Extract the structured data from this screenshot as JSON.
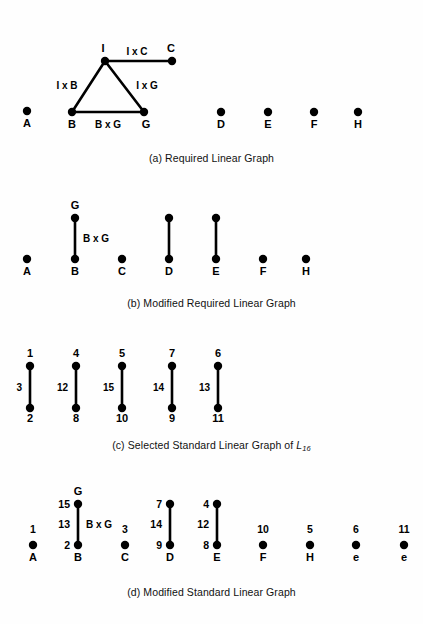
{
  "figure": {
    "background_color": "#fefefe",
    "ink_color": "#000000"
  },
  "panels": [
    {
      "id": "a",
      "caption": "(a) Required Linear Graph",
      "caption_y": 158,
      "nodes": [
        {
          "name": "A",
          "label": "A",
          "x": 27,
          "y": 111,
          "label_x": 27,
          "label_y": 127,
          "label_anchor": "middle"
        },
        {
          "name": "B",
          "label": "B",
          "x": 72,
          "y": 112,
          "label_x": 72,
          "label_y": 128,
          "label_anchor": "middle"
        },
        {
          "name": "G",
          "label": "G",
          "x": 144,
          "y": 112,
          "label_x": 146,
          "label_y": 128,
          "label_anchor": "middle"
        },
        {
          "name": "I",
          "label": "I",
          "x": 105,
          "y": 61,
          "label_x": 103,
          "label_y": 52,
          "label_anchor": "middle"
        },
        {
          "name": "C",
          "label": "C",
          "x": 172,
          "y": 61,
          "label_x": 171,
          "label_y": 52,
          "label_anchor": "middle"
        },
        {
          "name": "D",
          "label": "D",
          "x": 221,
          "y": 112,
          "label_x": 221,
          "label_y": 128,
          "label_anchor": "middle"
        },
        {
          "name": "E",
          "label": "E",
          "x": 268,
          "y": 112,
          "label_x": 268,
          "label_y": 128,
          "label_anchor": "middle"
        },
        {
          "name": "F",
          "label": "F",
          "x": 314,
          "y": 112,
          "label_x": 314,
          "label_y": 128,
          "label_anchor": "middle"
        },
        {
          "name": "H",
          "label": "H",
          "x": 358,
          "y": 112,
          "label_x": 358,
          "label_y": 128,
          "label_anchor": "middle"
        }
      ],
      "edges": [
        {
          "name": "edge-I-C",
          "x1": 105,
          "y1": 61,
          "x2": 172,
          "y2": 61,
          "label": "I x C",
          "label_x": 137,
          "label_y": 55,
          "label_anchor": "middle"
        },
        {
          "name": "edge-I-B",
          "x1": 105,
          "y1": 61,
          "x2": 72,
          "y2": 112,
          "label": "I x B",
          "label_x": 67,
          "label_y": 89,
          "label_anchor": "middle"
        },
        {
          "name": "edge-I-G",
          "x1": 105,
          "y1": 61,
          "x2": 144,
          "y2": 112,
          "label": "I x G",
          "label_x": 147,
          "label_y": 89,
          "label_anchor": "middle"
        },
        {
          "name": "edge-B-G",
          "x1": 72,
          "y1": 112,
          "x2": 144,
          "y2": 112,
          "label": "B x G",
          "label_x": 108,
          "label_y": 128,
          "label_anchor": "middle"
        }
      ]
    },
    {
      "id": "b",
      "caption": "(b) Modified Required Linear Graph",
      "caption_y": 303,
      "nodes": [
        {
          "name": "A",
          "label": "A",
          "x": 27,
          "y": 259,
          "label_x": 27,
          "label_y": 275,
          "label_anchor": "middle"
        },
        {
          "name": "B",
          "label": "B",
          "x": 75,
          "y": 259,
          "label_x": 75,
          "label_y": 275,
          "label_anchor": "middle"
        },
        {
          "name": "G",
          "label": "G",
          "x": 75,
          "y": 218,
          "label_x": 75,
          "label_y": 209,
          "label_anchor": "middle"
        },
        {
          "name": "C",
          "label": "C",
          "x": 122,
          "y": 259,
          "label_x": 122,
          "label_y": 275,
          "label_anchor": "middle"
        },
        {
          "name": "D",
          "label": "D",
          "x": 169,
          "y": 259,
          "label_x": 169,
          "label_y": 275,
          "label_anchor": "middle"
        },
        {
          "name": "E",
          "label": "E",
          "x": 216,
          "y": 259,
          "label_x": 216,
          "label_y": 275,
          "label_anchor": "middle"
        },
        {
          "name": "F",
          "label": "F",
          "x": 263,
          "y": 259,
          "label_x": 263,
          "label_y": 275,
          "label_anchor": "middle"
        },
        {
          "name": "H",
          "label": "H",
          "x": 306,
          "y": 259,
          "label_x": 306,
          "label_y": 275,
          "label_anchor": "middle"
        },
        {
          "name": "D-top",
          "label": "",
          "x": 169,
          "y": 218,
          "label_x": 169,
          "label_y": 218,
          "label_anchor": "middle"
        },
        {
          "name": "E-top",
          "label": "",
          "x": 216,
          "y": 218,
          "label_x": 216,
          "label_y": 218,
          "label_anchor": "middle"
        }
      ],
      "edges": [
        {
          "name": "edge-B-G",
          "x1": 75,
          "y1": 218,
          "x2": 75,
          "y2": 259,
          "label": "B x G",
          "label_x": 83,
          "label_y": 242,
          "label_anchor": "start"
        },
        {
          "name": "edge-D",
          "x1": 169,
          "y1": 218,
          "x2": 169,
          "y2": 259,
          "label": "",
          "label_x": 169,
          "label_y": 242,
          "label_anchor": "start"
        },
        {
          "name": "edge-E",
          "x1": 216,
          "y1": 218,
          "x2": 216,
          "y2": 259,
          "label": "",
          "label_x": 216,
          "label_y": 242,
          "label_anchor": "start"
        }
      ]
    },
    {
      "id": "c",
      "caption_prefix": "(c) Selected Standard Linear Graph of ",
      "caption_symbol": "L",
      "caption_subscript": "16",
      "caption_y": 445,
      "nodes": [
        {
          "name": "node-1",
          "label": "1",
          "x": 30,
          "y": 366,
          "label_x": 30,
          "label_y": 357,
          "label_anchor": "middle"
        },
        {
          "name": "node-2",
          "label": "2",
          "x": 30,
          "y": 408,
          "label_x": 30,
          "label_y": 422,
          "label_anchor": "middle"
        },
        {
          "name": "node-4",
          "label": "4",
          "x": 76,
          "y": 366,
          "label_x": 76,
          "label_y": 357,
          "label_anchor": "middle"
        },
        {
          "name": "node-8",
          "label": "8",
          "x": 76,
          "y": 408,
          "label_x": 76,
          "label_y": 422,
          "label_anchor": "middle"
        },
        {
          "name": "node-5",
          "label": "5",
          "x": 122,
          "y": 366,
          "label_x": 122,
          "label_y": 357,
          "label_anchor": "middle"
        },
        {
          "name": "node-10",
          "label": "10",
          "x": 122,
          "y": 408,
          "label_x": 122,
          "label_y": 422,
          "label_anchor": "middle"
        },
        {
          "name": "node-7",
          "label": "7",
          "x": 172,
          "y": 366,
          "label_x": 172,
          "label_y": 357,
          "label_anchor": "middle"
        },
        {
          "name": "node-9",
          "label": "9",
          "x": 172,
          "y": 408,
          "label_x": 172,
          "label_y": 422,
          "label_anchor": "middle"
        },
        {
          "name": "node-6",
          "label": "6",
          "x": 218,
          "y": 366,
          "label_x": 218,
          "label_y": 357,
          "label_anchor": "middle"
        },
        {
          "name": "node-11",
          "label": "11",
          "x": 218,
          "y": 408,
          "label_x": 218,
          "label_y": 422,
          "label_anchor": "middle"
        }
      ],
      "edges": [
        {
          "name": "edge-3",
          "x1": 30,
          "y1": 366,
          "x2": 30,
          "y2": 408,
          "label": "3",
          "label_x": 22,
          "label_y": 391,
          "label_anchor": "end"
        },
        {
          "name": "edge-12",
          "x1": 76,
          "y1": 366,
          "x2": 76,
          "y2": 408,
          "label": "12",
          "label_x": 68,
          "label_y": 391,
          "label_anchor": "end"
        },
        {
          "name": "edge-15",
          "x1": 122,
          "y1": 366,
          "x2": 122,
          "y2": 408,
          "label": "15",
          "label_x": 114,
          "label_y": 391,
          "label_anchor": "end"
        },
        {
          "name": "edge-14",
          "x1": 172,
          "y1": 366,
          "x2": 172,
          "y2": 408,
          "label": "14",
          "label_x": 164,
          "label_y": 391,
          "label_anchor": "end"
        },
        {
          "name": "edge-13",
          "x1": 218,
          "y1": 366,
          "x2": 218,
          "y2": 408,
          "label": "13",
          "label_x": 210,
          "label_y": 391,
          "label_anchor": "end"
        }
      ]
    },
    {
      "id": "d",
      "caption": "(d) Modified Standard Linear Graph",
      "caption_y": 592,
      "nodes": [
        {
          "name": "A",
          "label": "A",
          "x": 33,
          "y": 545,
          "label_x": 33,
          "label_y": 561,
          "label_anchor": "middle",
          "num": "1",
          "num_x": 33,
          "num_y": 533,
          "num_anchor": "middle"
        },
        {
          "name": "B",
          "label": "B",
          "x": 78,
          "y": 545,
          "label_x": 78,
          "label_y": 561,
          "label_anchor": "middle",
          "num": "2",
          "num_x": 70,
          "num_y": 549,
          "num_anchor": "end"
        },
        {
          "name": "G",
          "label": "G",
          "x": 78,
          "y": 504,
          "label_x": 78,
          "label_y": 495,
          "label_anchor": "middle",
          "num": "15",
          "num_x": 70,
          "num_y": 508,
          "num_anchor": "end"
        },
        {
          "name": "C",
          "label": "C",
          "x": 125,
          "y": 545,
          "label_x": 125,
          "label_y": 561,
          "label_anchor": "middle",
          "num": "3",
          "num_x": 125,
          "num_y": 533,
          "num_anchor": "middle"
        },
        {
          "name": "D",
          "label": "D",
          "x": 170,
          "y": 545,
          "label_x": 170,
          "label_y": 561,
          "label_anchor": "middle",
          "num": "9",
          "num_x": 162,
          "num_y": 549,
          "num_anchor": "end"
        },
        {
          "name": "D-top",
          "label": "",
          "x": 170,
          "y": 504,
          "label_x": 170,
          "label_y": 504,
          "label_anchor": "middle",
          "num": "7",
          "num_x": 162,
          "num_y": 508,
          "num_anchor": "end"
        },
        {
          "name": "E",
          "label": "E",
          "x": 217,
          "y": 545,
          "label_x": 217,
          "label_y": 561,
          "label_anchor": "middle",
          "num": "8",
          "num_x": 209,
          "num_y": 549,
          "num_anchor": "end"
        },
        {
          "name": "E-top",
          "label": "",
          "x": 217,
          "y": 504,
          "label_x": 217,
          "label_y": 504,
          "label_anchor": "middle",
          "num": "4",
          "num_x": 209,
          "num_y": 508,
          "num_anchor": "end"
        },
        {
          "name": "F",
          "label": "F",
          "x": 263,
          "y": 545,
          "label_x": 263,
          "label_y": 561,
          "label_anchor": "middle",
          "num": "10",
          "num_x": 263,
          "num_y": 533,
          "num_anchor": "middle"
        },
        {
          "name": "H",
          "label": "H",
          "x": 310,
          "y": 545,
          "label_x": 310,
          "label_y": 561,
          "label_anchor": "middle",
          "num": "5",
          "num_x": 310,
          "num_y": 533,
          "num_anchor": "middle"
        },
        {
          "name": "e1",
          "label": "e",
          "x": 356,
          "y": 545,
          "label_x": 356,
          "label_y": 561,
          "label_anchor": "middle",
          "num": "6",
          "num_x": 356,
          "num_y": 533,
          "num_anchor": "middle"
        },
        {
          "name": "e2",
          "label": "e",
          "x": 404,
          "y": 545,
          "label_x": 404,
          "label_y": 561,
          "label_anchor": "middle",
          "num": "11",
          "num_x": 404,
          "num_y": 533,
          "num_anchor": "middle"
        }
      ],
      "edges": [
        {
          "name": "edge-B-G",
          "x1": 78,
          "y1": 504,
          "x2": 78,
          "y2": 545,
          "label": "B x G",
          "label_x": 86,
          "label_y": 528,
          "label_anchor": "start",
          "num": "13",
          "num_x": 70,
          "num_y": 528,
          "num_anchor": "end"
        },
        {
          "name": "edge-D",
          "x1": 170,
          "y1": 504,
          "x2": 170,
          "y2": 545,
          "label": "",
          "label_x": 178,
          "label_y": 528,
          "label_anchor": "start",
          "num": "14",
          "num_x": 162,
          "num_y": 528,
          "num_anchor": "end"
        },
        {
          "name": "edge-E",
          "x1": 217,
          "y1": 504,
          "x2": 217,
          "y2": 545,
          "label": "",
          "label_x": 225,
          "label_y": 528,
          "label_anchor": "start",
          "num": "12",
          "num_x": 209,
          "num_y": 528,
          "num_anchor": "end"
        }
      ]
    }
  ]
}
